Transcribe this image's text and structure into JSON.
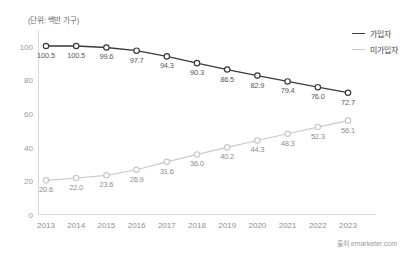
{
  "unit_label": "(단위: 백만 가구)",
  "source": "출처 emarketer.com",
  "colors": {
    "series_subscribers": "#3a3a3a",
    "series_nonsubscribers": "#c9c9c9",
    "axis": "#d8d8d8",
    "tick_text": "#9a9a9a"
  },
  "legend": {
    "items": [
      {
        "label": "가입자"
      },
      {
        "label": "미가입자"
      }
    ]
  },
  "chart_data": {
    "type": "line",
    "title": "",
    "subtitle": "",
    "xlabel": "",
    "ylabel": "",
    "unit": "백만 가구",
    "grid": false,
    "legend_position": "right-top",
    "ylim": [
      0,
      110
    ],
    "yticks": [
      0,
      20,
      40,
      60,
      80,
      100
    ],
    "categories": [
      "2013",
      "2014",
      "2015",
      "2016",
      "2017",
      "2018",
      "2019",
      "2020",
      "2021",
      "2022",
      "2023"
    ],
    "series": [
      {
        "name": "가입자",
        "color": "#3a3a3a",
        "marker": "open-circle",
        "values": [
          100.5,
          100.5,
          99.6,
          97.7,
          94.3,
          90.3,
          86.5,
          82.9,
          79.4,
          76.0,
          72.7
        ],
        "labels": [
          "100.5",
          "100.5",
          "99.6",
          "97.7",
          "94.3",
          "90.3",
          "86.5",
          "82.9",
          "79.4",
          "76.0",
          "72.7"
        ]
      },
      {
        "name": "미가입자",
        "color": "#c9c9c9",
        "marker": "open-circle",
        "values": [
          20.6,
          22.0,
          23.6,
          26.9,
          31.6,
          36.0,
          40.2,
          44.3,
          48.3,
          52.3,
          56.1
        ],
        "labels": [
          "20.6",
          "22.0",
          "23.6",
          "26.9",
          "31.6",
          "36.0",
          "40.2",
          "44.3",
          "48.3",
          "52.3",
          "56.1"
        ]
      }
    ]
  }
}
